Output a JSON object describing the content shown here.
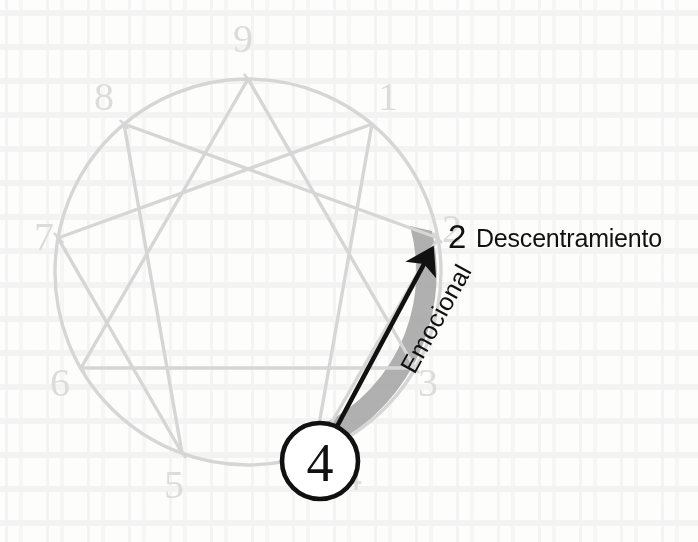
{
  "diagram": {
    "type": "enneagram",
    "colors": {
      "figure_line": "#d6d6d6",
      "point_number": "#dcdcdc",
      "band": "#a9a9a9",
      "arrow": "#111111",
      "circle_marker": "#111111",
      "background": "#fdfdfc"
    },
    "circle": {
      "center_x": 248,
      "center_y": 272,
      "radius": 193
    },
    "points": [
      {
        "id": "p9",
        "number": "9",
        "angle_deg": 270,
        "label_x": 243,
        "label_y": 22
      },
      {
        "id": "p1",
        "number": "1",
        "angle_deg": 310,
        "label_x": 382,
        "label_y": 82
      },
      {
        "id": "p2",
        "number": "2",
        "angle_deg": 350,
        "label_x": 444,
        "label_y": 210
      },
      {
        "id": "p3",
        "number": "3",
        "angle_deg": 30,
        "label_x": 418,
        "label_y": 362
      },
      {
        "id": "p4",
        "number": "4",
        "angle_deg": 70,
        "label_x": 352,
        "label_y": 462
      },
      {
        "id": "p5",
        "number": "5",
        "angle_deg": 110,
        "label_x": 163,
        "label_y": 466
      },
      {
        "id": "p6",
        "number": "6",
        "angle_deg": 150,
        "label_x": 46,
        "label_y": 370
      },
      {
        "id": "p7",
        "number": "7",
        "angle_deg": 190,
        "label_x": 34,
        "label_y": 222
      },
      {
        "id": "p8",
        "number": "8",
        "angle_deg": 230,
        "label_x": 92,
        "label_y": 82
      }
    ],
    "triangle_path": [
      "p9",
      "p3",
      "p6"
    ],
    "hexad_path": [
      "p1",
      "p4",
      "p2",
      "p8",
      "p5",
      "p7"
    ],
    "band": {
      "from_point": "p4",
      "to_point": "p2",
      "description": "shaded arc band along circle from point 4 to point 2"
    },
    "arrow": {
      "from": {
        "x": 326,
        "y": 447
      },
      "to": {
        "x": 437,
        "y": 239
      },
      "description": "direction of disintegration from 4 to 2"
    },
    "marker": {
      "number": "4",
      "center_x": 320,
      "center_y": 461,
      "radius": 38
    },
    "annotations": {
      "target_number": "2",
      "target_label": "Descentramiento",
      "axis_label": "Emocional"
    }
  }
}
